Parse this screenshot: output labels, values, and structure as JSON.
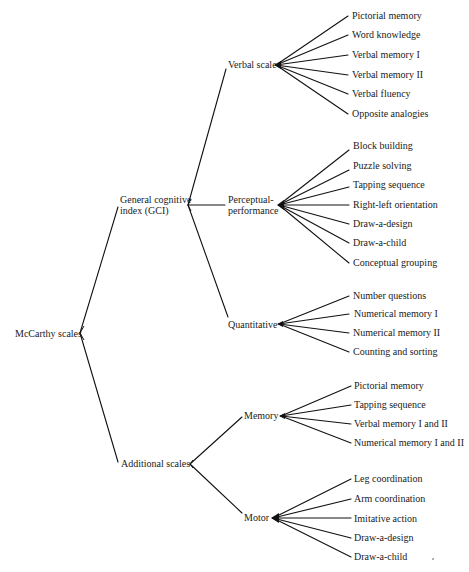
{
  "diagram": {
    "type": "tree",
    "root": {
      "label": "McCarthy scales",
      "children": [
        {
          "label": "General cognitive index (GCI)",
          "label_lines": [
            "General cognitive",
            "index (GCI)"
          ],
          "children": [
            {
              "label": "Verbal scale",
              "children": [
                "Pictorial memory",
                "Word knowledge",
                "Verbal memory I",
                "Verbal memory II",
                "Verbal fluency",
                "Opposite analogies"
              ]
            },
            {
              "label": "Perceptual-performance",
              "label_lines": [
                "Perceptual-",
                "performance"
              ],
              "children": [
                "Block building",
                "Puzzle solving",
                "Tapping sequence",
                "Right-left orientation",
                "Draw-a-design",
                "Draw-a-child",
                "Conceptual grouping"
              ]
            },
            {
              "label": "Quantitative",
              "children": [
                "Number questions",
                "Numerical memory I",
                "Numerical memory II",
                "Counting and sorting"
              ]
            }
          ]
        },
        {
          "label": "Additional scales",
          "children": [
            {
              "label": "Memory",
              "children": [
                "Pictorial memory",
                "Tapping sequence",
                "Verbal memory I and II",
                "Numerical memory I and II"
              ]
            },
            {
              "label": "Motor",
              "children": [
                "Leg coordination",
                "Arm coordination",
                "Imitative action",
                "Draw-a-design",
                "Draw-a-child"
              ]
            }
          ]
        }
      ]
    }
  },
  "labels": {
    "root": "McCarthy scales",
    "gci_1": "General cognitive",
    "gci_2": "index (GCI)",
    "additional": "Additional scales",
    "verbal": "Verbal scale",
    "perc_1": "Perceptual-",
    "perc_2": "performance",
    "quant": "Quantitative",
    "memory": "Memory",
    "motor": "Motor",
    "verbal_items": [
      "Pictorial memory",
      "Word knowledge",
      "Verbal memory I",
      "Verbal memory II",
      "Verbal fluency",
      "Opposite analogies"
    ],
    "perc_items": [
      "Block building",
      "Puzzle solving",
      "Tapping sequence",
      "Right-left orientation",
      "Draw-a-design",
      "Draw-a-child",
      "Conceptual grouping"
    ],
    "quant_items": [
      "Number questions",
      "Numerical memory I",
      "Numerical memory II",
      "Counting and sorting"
    ],
    "memory_items": [
      "Pictorial memory",
      "Tapping sequence",
      "Verbal memory I and II",
      "Numerical memory I and II"
    ],
    "motor_items": [
      "Leg coordination",
      "Arm coordination",
      "Imitative action",
      "Draw-a-design",
      "Draw-a-child"
    ]
  },
  "colors": {
    "line": "#111111",
    "text": "#1a1a1a",
    "background": "#ffffff"
  }
}
